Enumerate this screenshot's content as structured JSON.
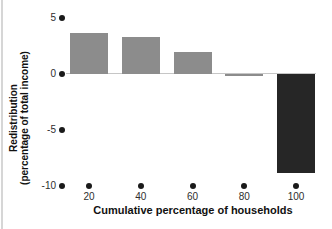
{
  "chart_data": {
    "type": "bar",
    "title": "",
    "xlabel": "Cumulative percentage of households",
    "ylabel": "Redistribution (percentage of total income)",
    "ylabel_lines": [
      "Redistribution",
      "(percentage of total income)"
    ],
    "categories": [
      "20",
      "40",
      "60",
      "80",
      "100"
    ],
    "values": [
      3.7,
      3.3,
      2.0,
      -0.1,
      -8.8
    ],
    "bar_colors": [
      "#8c8c8c",
      "#8c8c8c",
      "#8c8c8c",
      "#8c8c8c",
      "#262626"
    ],
    "yticks": [
      {
        "label": "5",
        "value": 5
      },
      {
        "label": "0",
        "value": 0
      },
      {
        "label": "-5",
        "value": -5
      },
      {
        "label": "-10",
        "value": -10
      }
    ],
    "ylim": [
      -10,
      5
    ],
    "grid": false,
    "legend_position": "none",
    "tick_marker": "dot"
  },
  "colors": {
    "background": "#ffffff",
    "bar_gray": "#8c8c8c",
    "bar_dark": "#262626",
    "axis_line": "#c6c6c6",
    "tick_dot": "#1a1a1a",
    "text": "#1f1f1f",
    "page_edge": "#d6d6d6"
  }
}
